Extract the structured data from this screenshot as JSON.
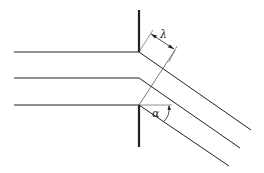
{
  "diagram": {
    "labels": {
      "wavelength": "λ",
      "angle": "α"
    },
    "colors": {
      "line": "#222222",
      "background": "#ffffff"
    }
  }
}
